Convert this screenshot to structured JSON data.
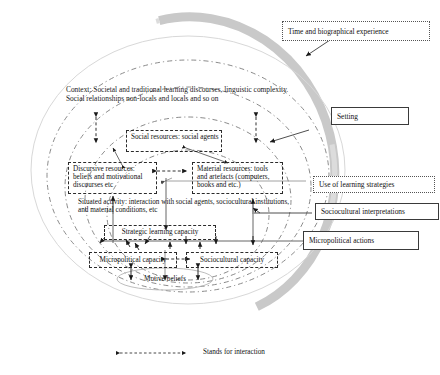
{
  "figure": {
    "context_text": "Context: Societal and traditional learning discourses, linguistic complexity. Social relationships non-locals and locals and so on",
    "legend": {
      "arrow_name": "double-headed-dashed-arrow",
      "text": "Stands for interaction"
    }
  },
  "callouts": [
    {
      "id": "time",
      "label": "Time and biographical experience",
      "border": "dotted"
    },
    {
      "id": "setting",
      "label": "Setting",
      "border": "solid"
    },
    {
      "id": "strategies",
      "label": "Use of learning strategies",
      "border": "dotted"
    },
    {
      "id": "interpretations",
      "label": "Sociocultural interpretations",
      "border": "solid"
    },
    {
      "id": "micropolitical",
      "label": "Micropolitical actions",
      "border": "solid"
    }
  ],
  "boxes": [
    {
      "id": "social-resources",
      "label": "Social resources: social agents"
    },
    {
      "id": "discursive-resources",
      "label": "Discursive resources: beliefs and motivational discourses etc"
    },
    {
      "id": "material-resources",
      "label": "Material resources: tools and artefacts (computers, books and etc.)"
    },
    {
      "id": "strategic-learning-capacity",
      "label": "Strategic learning capacity"
    },
    {
      "id": "micropolitical-capacity",
      "label": "Micropolitical capacity"
    },
    {
      "id": "sociocultural-capacity",
      "label": "Sociocultural capacity"
    }
  ],
  "plain_labels": [
    {
      "id": "situated-activity",
      "label": "Situated activity: interaction with social agents, sociocultural institutions, and material conditions, etc"
    },
    {
      "id": "motive-beliefs",
      "label": "Motive/beliefs"
    }
  ],
  "colors": {
    "outer_ring_gray": "#bfbfbf",
    "outer_ellipse_line": "#d6d6d6",
    "dashed_ellipse_line": "#7a7a7a",
    "box_border": "#2b2b2b",
    "callout_border": "#3a3a3a",
    "arrow_dark": "#1a1a1a",
    "connector_gray": "#6a6a6a",
    "text": "#111111",
    "background": "#ffffff"
  }
}
